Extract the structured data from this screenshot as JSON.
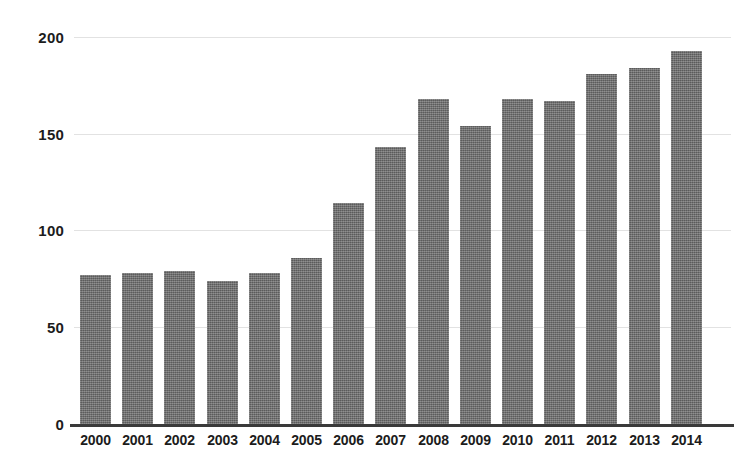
{
  "chart_data": {
    "type": "bar",
    "title": "",
    "subtitle": "",
    "xlabel": "",
    "ylabel": "",
    "categories": [
      "2000",
      "2001",
      "2002",
      "2003",
      "2004",
      "2005",
      "2006",
      "2007",
      "2008",
      "2009",
      "2010",
      "2011",
      "2012",
      "2013",
      "2014"
    ],
    "values": [
      77,
      78,
      79,
      74,
      78,
      86,
      114,
      143,
      168,
      154,
      168,
      167,
      181,
      184,
      193
    ],
    "series": [
      {
        "name": "",
        "values": [
          77,
          78,
          79,
          74,
          78,
          86,
          114,
          143,
          168,
          154,
          168,
          167,
          181,
          184,
          193
        ]
      }
    ],
    "ylim": [
      0,
      200
    ],
    "yticks": [
      0,
      50,
      100,
      150,
      200
    ],
    "ytick_labels": [
      "0",
      "50",
      "100",
      "150",
      "200"
    ],
    "xtick_labels": [
      "2000",
      "2001",
      "2002",
      "2003",
      "2004",
      "2005",
      "2006",
      "2007",
      "2008",
      "2009",
      "2010",
      "2011",
      "2012",
      "2013",
      "2014"
    ],
    "grid": true,
    "grid_axis": "y",
    "legend": false,
    "legend_position": "none",
    "annotations": [],
    "colors": {
      "bar_fill": "#6e6e6e",
      "gridline": "#e2e2e2",
      "axis_line": "#3a3a3a",
      "tick_text": "#1c1c1c",
      "background": "#ffffff"
    }
  },
  "axis": {
    "y": {
      "ticks": [
        {
          "label": "200",
          "value": 200
        },
        {
          "label": "150",
          "value": 150
        },
        {
          "label": "100",
          "value": 100
        },
        {
          "label": "50",
          "value": 50
        },
        {
          "label": "0",
          "value": 0
        }
      ]
    }
  }
}
